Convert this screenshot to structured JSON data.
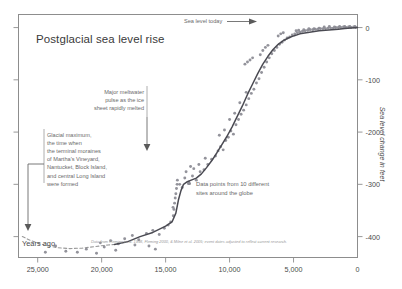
{
  "title": "Postglacial sea level rise",
  "axes": {
    "x_title": "Years ago",
    "y_title": "Sea level change in feet",
    "x_ticks": [
      "25,000",
      "20,000",
      "15,000",
      "10,000",
      "5,000",
      "0"
    ],
    "y_ticks": [
      "0",
      "-100",
      "-200",
      "-300",
      "-400"
    ]
  },
  "annotations": {
    "sea_level_today": "Sea level today",
    "meltwater_pulse": "Major meltwater\npulse as the ice\nsheet rapidly melted",
    "glacial_maximum": "Glacial maximum,\nthe time when\nthe terminal moraines\nof Martha's Vineyard,\nNantucket, Block Island,\nand central Long Island\nwere formed"
  },
  "legend": {
    "text": "Data points from 10 different\nsites around the globe",
    "marker_color": "#8a8a93"
  },
  "source_note": "Data from Fleming et al. 1998, Fleming 2000, & Milne et al. 2005; event dates adjusted to reflect current research.",
  "colors": {
    "frame": "#8d8d8d",
    "curve": "#4a4a52",
    "points": "#8a8a93",
    "text": "#4a4a4a",
    "muted_text": "#6a6a6a"
  },
  "chart_data": {
    "type": "scatter",
    "title": "Postglacial sea level rise",
    "xlabel": "Years ago",
    "ylabel": "Sea level change in feet",
    "xlim": [
      26500,
      0
    ],
    "ylim": [
      -440,
      25
    ],
    "x_reversed": true,
    "grid": false,
    "legend_position": "inside-right",
    "series": [
      {
        "name": "Fitted sea level curve (solid)",
        "type": "line",
        "style": "solid",
        "points": [
          [
            19000,
            -415
          ],
          [
            18000,
            -410
          ],
          [
            17000,
            -400
          ],
          [
            16000,
            -392
          ],
          [
            15000,
            -380
          ],
          [
            14500,
            -372
          ],
          [
            14200,
            -355
          ],
          [
            14000,
            -330
          ],
          [
            13800,
            -312
          ],
          [
            13600,
            -300
          ],
          [
            13300,
            -295
          ],
          [
            13000,
            -292
          ],
          [
            12600,
            -288
          ],
          [
            12200,
            -280
          ],
          [
            11800,
            -268
          ],
          [
            11400,
            -255
          ],
          [
            11000,
            -240
          ],
          [
            10600,
            -224
          ],
          [
            10200,
            -208
          ],
          [
            9800,
            -190
          ],
          [
            9400,
            -170
          ],
          [
            9000,
            -150
          ],
          [
            8600,
            -128
          ],
          [
            8200,
            -108
          ],
          [
            7800,
            -88
          ],
          [
            7400,
            -70
          ],
          [
            7000,
            -55
          ],
          [
            6600,
            -42
          ],
          [
            6200,
            -32
          ],
          [
            5800,
            -25
          ],
          [
            5400,
            -20
          ],
          [
            5000,
            -16
          ],
          [
            4500,
            -12
          ],
          [
            4000,
            -10
          ],
          [
            3500,
            -8
          ],
          [
            3000,
            -6
          ],
          [
            2500,
            -5
          ],
          [
            2000,
            -4
          ],
          [
            1500,
            -3
          ],
          [
            1000,
            -2
          ],
          [
            500,
            -1
          ],
          [
            0,
            0
          ]
        ]
      },
      {
        "name": "Extrapolated curve (dashed)",
        "type": "line",
        "style": "dashed",
        "points": [
          [
            26200,
            -400
          ],
          [
            25500,
            -408
          ],
          [
            24500,
            -416
          ],
          [
            23500,
            -421
          ],
          [
            22500,
            -423
          ],
          [
            21500,
            -422
          ],
          [
            20500,
            -419
          ],
          [
            19500,
            -416
          ],
          [
            19000,
            -415
          ]
        ]
      },
      {
        "name": "Data points from 10 different sites around the globe",
        "type": "scatter",
        "points": [
          [
            22800,
            -428
          ],
          [
            21900,
            -430
          ],
          [
            21200,
            -424
          ],
          [
            20400,
            -432
          ],
          [
            19800,
            -420
          ],
          [
            19300,
            -408
          ],
          [
            18700,
            -414
          ],
          [
            18200,
            -404
          ],
          [
            17600,
            -398
          ],
          [
            17100,
            -406
          ],
          [
            16500,
            -394
          ],
          [
            16000,
            -388
          ],
          [
            15500,
            -396
          ],
          [
            15100,
            -384
          ],
          [
            14800,
            -378
          ],
          [
            14600,
            -372
          ],
          [
            14400,
            -360
          ],
          [
            14350,
            -348
          ],
          [
            14300,
            -336
          ],
          [
            14250,
            -326
          ],
          [
            14200,
            -318
          ],
          [
            14150,
            -308
          ],
          [
            14100,
            -300
          ],
          [
            14420,
            -344
          ],
          [
            14080,
            -292
          ],
          [
            13900,
            -300
          ],
          [
            13700,
            -306
          ],
          [
            13500,
            -288
          ],
          [
            13200,
            -296
          ],
          [
            12900,
            -284
          ],
          [
            12600,
            -292
          ],
          [
            12300,
            -276
          ],
          [
            12000,
            -272
          ],
          [
            11700,
            -262
          ],
          [
            11400,
            -252
          ],
          [
            11100,
            -246
          ],
          [
            10900,
            -236
          ],
          [
            10700,
            -228
          ],
          [
            10500,
            -234
          ],
          [
            10300,
            -216
          ],
          [
            10100,
            -210
          ],
          [
            9900,
            -198
          ],
          [
            9700,
            -204
          ],
          [
            9500,
            -186
          ],
          [
            9300,
            -176
          ],
          [
            9100,
            -166
          ],
          [
            8900,
            -158
          ],
          [
            8700,
            -148
          ],
          [
            8500,
            -136
          ],
          [
            8300,
            -126
          ],
          [
            8100,
            -118
          ],
          [
            7900,
            -106
          ],
          [
            7700,
            -98
          ],
          [
            7500,
            -86
          ],
          [
            7300,
            -76
          ],
          [
            7100,
            -66
          ],
          [
            6900,
            -58
          ],
          [
            6700,
            -50
          ],
          [
            6500,
            -44
          ],
          [
            6300,
            -38
          ],
          [
            6100,
            -32
          ],
          [
            5900,
            -28
          ],
          [
            5700,
            -24
          ],
          [
            5500,
            -20
          ],
          [
            5300,
            -18
          ],
          [
            5100,
            -14
          ],
          [
            4900,
            -12
          ],
          [
            4700,
            -10
          ],
          [
            4500,
            -9
          ],
          [
            4300,
            -7
          ],
          [
            4100,
            -6
          ],
          [
            3900,
            -5
          ],
          [
            3700,
            -4
          ],
          [
            3500,
            -4
          ],
          [
            3300,
            -3
          ],
          [
            3100,
            -3
          ],
          [
            2900,
            -2
          ],
          [
            2700,
            -2
          ],
          [
            2500,
            -2
          ],
          [
            2300,
            -1
          ],
          [
            2100,
            -1
          ],
          [
            1900,
            -1
          ],
          [
            1700,
            0
          ],
          [
            1500,
            0
          ],
          [
            1300,
            0
          ],
          [
            1100,
            1
          ],
          [
            900,
            0
          ],
          [
            700,
            1
          ],
          [
            500,
            0
          ],
          [
            300,
            1
          ],
          [
            150,
            0
          ],
          [
            8800,
            -70
          ],
          [
            8600,
            -66
          ],
          [
            8400,
            -62
          ],
          [
            8200,
            -58
          ],
          [
            7600,
            -52
          ],
          [
            7400,
            -44
          ],
          [
            7200,
            -38
          ],
          [
            7000,
            -34
          ],
          [
            6200,
            -16
          ],
          [
            6000,
            -12
          ],
          [
            5800,
            -10
          ],
          [
            4800,
            -6
          ],
          [
            4600,
            -5
          ],
          [
            4200,
            -4
          ],
          [
            3800,
            -2
          ],
          [
            3400,
            -2
          ],
          [
            3000,
            -1
          ],
          [
            2600,
            1
          ],
          [
            2200,
            2
          ],
          [
            1800,
            1
          ],
          [
            1400,
            2
          ],
          [
            1000,
            2
          ],
          [
            600,
            2
          ],
          [
            200,
            2
          ],
          [
            10800,
            -206
          ],
          [
            10400,
            -196
          ],
          [
            10000,
            -176
          ],
          [
            9600,
            -164
          ],
          [
            9200,
            -144
          ],
          [
            8700,
            -124
          ],
          [
            12800,
            -270
          ],
          [
            12400,
            -262
          ],
          [
            11900,
            -250
          ],
          [
            13400,
            -276
          ],
          [
            13050,
            -266
          ],
          [
            15800,
            -424
          ],
          [
            16300,
            -418
          ],
          [
            17400,
            -416
          ],
          [
            18900,
            -426
          ],
          [
            20100,
            -412
          ],
          [
            23600,
            -418
          ],
          [
            24400,
            -430
          ]
        ]
      }
    ]
  }
}
